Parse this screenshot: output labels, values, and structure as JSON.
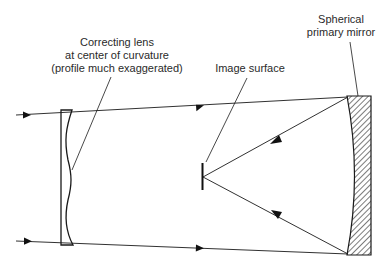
{
  "diagram": {
    "labels": {
      "corrector": [
        "Correcting lens",
        "at center of curvature",
        "(profile much exaggerated)"
      ],
      "image_surface": "Image surface",
      "mirror": [
        "Spherical",
        "primary mirror"
      ]
    },
    "components": [
      "corrector-plate",
      "image-surface",
      "spherical-primary-mirror"
    ],
    "rays": [
      {
        "name": "incoming-upper-ray",
        "direction": "left-to-right"
      },
      {
        "name": "incoming-lower-ray",
        "direction": "left-to-right"
      },
      {
        "name": "reflected-upper-ray",
        "direction": "mirror-to-focus"
      },
      {
        "name": "reflected-lower-ray",
        "direction": "mirror-to-focus"
      }
    ],
    "colors": {
      "line": "#1a1a1a",
      "text": "#2a2a2a",
      "background": "#ffffff"
    }
  }
}
